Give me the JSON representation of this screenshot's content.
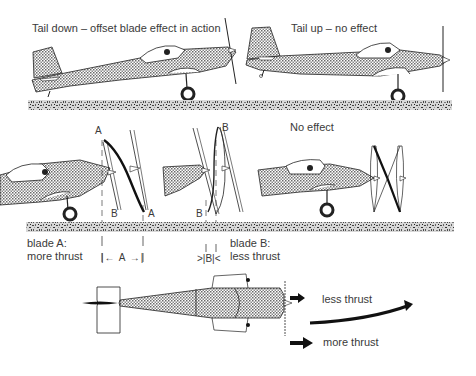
{
  "diagram": {
    "type": "technical-illustration",
    "panels": {
      "top_left": {
        "caption": "Tail down – offset blade effect in action"
      },
      "top_right": {
        "caption": "Tail up – no effect"
      },
      "middle_left": {
        "blade_labels": [
          "A",
          "B",
          "B",
          "A"
        ],
        "measure_label": "A",
        "measure_arrows": "|← A →|",
        "caption_line1": "blade A:",
        "caption_line2": "more thrust"
      },
      "middle_center": {
        "blade_labels": [
          "B",
          "B"
        ],
        "measure_label": "B",
        "measure_arrows": ">|B|<",
        "caption_line1": "blade B:",
        "caption_line2": "less thrust"
      },
      "middle_right": {
        "caption": "No effect"
      },
      "bottom": {
        "label_top": "less thrust",
        "label_bottom": "more thrust",
        "yaw_arrow": "curved arrow indicating yaw to the left"
      }
    },
    "colors": {
      "line": "#222222",
      "fill_stipple": "#b8b8b8",
      "text": "#3a3a3a",
      "ground": "#8a8a8a"
    }
  }
}
